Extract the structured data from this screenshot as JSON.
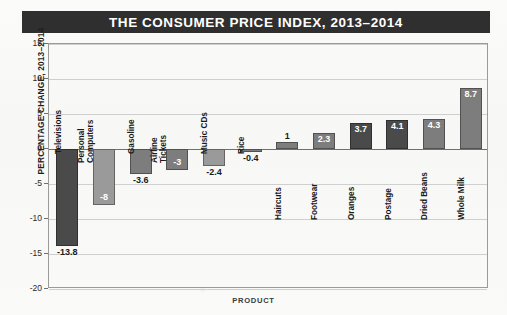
{
  "title": "THE CONSUMER PRICE INDEX, 2013–2014",
  "axes": {
    "y_title": "PERCENTAGE CHANGE, 2013–2014",
    "x_title": "PRODUCT",
    "y_ticks": [
      "15",
      "10",
      "5",
      "0",
      "-5",
      "-10",
      "-15",
      "-20"
    ]
  },
  "colors": {
    "title_bar_bg": "#2f2f2f",
    "title_bar_text": "#ffffff",
    "bar_dark": "#4a4a4a",
    "bar_mid": "#7d7d7d",
    "bar_light": "#9a9a9a",
    "gridline": "#cfcfcf",
    "zero_line": "#6f6f6f",
    "frame": "#9a9a9a",
    "page_bg": "#faf9f8"
  },
  "chart_data": {
    "type": "bar",
    "title": "THE CONSUMER PRICE INDEX, 2013–2014",
    "xlabel": "PRODUCT",
    "ylabel": "PERCENTAGE CHANGE, 2013–2014",
    "ylim": [
      -20,
      15
    ],
    "ytick_step": 5,
    "grid": true,
    "legend": "none",
    "categories": [
      "Televisions",
      "Personal Computers",
      "Gasoline",
      "Airline Tickets",
      "Music CDs",
      "Rice",
      "Haircuts",
      "Footwear",
      "Oranges",
      "Postage",
      "Dried Beans",
      "Whole Milk"
    ],
    "values": [
      -13.8,
      -8,
      -3.6,
      -3,
      -2.4,
      -0.4,
      1,
      2.3,
      3.7,
      4.1,
      4.3,
      8.7
    ],
    "labels": [
      "-13.8",
      "-8",
      "-3.6",
      "-3",
      "-2.4",
      "-0.4",
      "1",
      "2.3",
      "3.7",
      "4.1",
      "4.3",
      "8.7"
    ],
    "bar_shades": [
      "dark",
      "light",
      "mid",
      "mid",
      "light",
      "mid",
      "mid",
      "mid",
      "dark",
      "dark",
      "mid",
      "mid"
    ],
    "label_placement": [
      "outside",
      "inside",
      "outside",
      "inside",
      "outside",
      "outside",
      "outside",
      "inside",
      "inside",
      "inside",
      "inside",
      "inside"
    ],
    "category_label_lines": [
      [
        "Televisions"
      ],
      [
        "Personal",
        "Computers"
      ],
      [
        "Gasoline"
      ],
      [
        "Airline",
        "Tickets"
      ],
      [
        "Music CDs"
      ],
      [
        "Rice"
      ],
      [
        "Haircuts"
      ],
      [
        "Footwear"
      ],
      [
        "Oranges"
      ],
      [
        "Postage"
      ],
      [
        "Dried Beans"
      ],
      [
        "Whole Milk"
      ]
    ]
  }
}
